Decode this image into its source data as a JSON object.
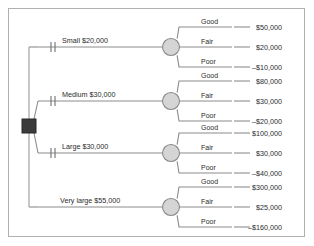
{
  "diagram": {
    "type": "decision-tree",
    "decision_node": {
      "shape": "square",
      "color": "#3b3b3b",
      "label": ""
    },
    "chance_node": {
      "shape": "circle",
      "fill": "#d5d5d5",
      "stroke": "#8a8a8a"
    },
    "line_color": "#8c8c8c",
    "pruned_marker": "double-hash",
    "alternatives": [
      {
        "label": "Small $20,000",
        "cost": "$20,000",
        "pruned": true,
        "outcomes": [
          {
            "state": "Good",
            "payoff": "$50,000"
          },
          {
            "state": "Fair",
            "payoff": "$20,000"
          },
          {
            "state": "Poor",
            "payoff": "–$10,000"
          }
        ]
      },
      {
        "label": "Medium $30,000",
        "cost": "$30,000",
        "pruned": true,
        "outcomes": [
          {
            "state": "Good",
            "payoff": "$80,000"
          },
          {
            "state": "Fair",
            "payoff": "$30,000"
          },
          {
            "state": "Poor",
            "payoff": "–$20,000"
          }
        ]
      },
      {
        "label": "Large $30,000",
        "cost": "$30,000",
        "pruned": true,
        "outcomes": [
          {
            "state": "Good",
            "payoff": "$100,000"
          },
          {
            "state": "Fair",
            "payoff": "$30,000"
          },
          {
            "state": "Poor",
            "payoff": "–$40,000"
          }
        ]
      },
      {
        "label": "Very large $55,000",
        "cost": "$55,000",
        "pruned": false,
        "outcomes": [
          {
            "state": "Good",
            "payoff": "$300,000"
          },
          {
            "state": "Fair",
            "payoff": "$25,000"
          },
          {
            "state": "Poor",
            "payoff": "–$160,000"
          }
        ]
      }
    ]
  }
}
